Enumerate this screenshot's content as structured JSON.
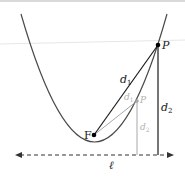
{
  "diagram": {
    "labels": {
      "point_p": "P",
      "point_p_secondary": "P",
      "focus": "F",
      "d1": "d",
      "d1_sub": "1",
      "d2": "d",
      "d2_sub": "2",
      "d1_secondary": "d",
      "d1_secondary_sub": "1",
      "d2_secondary": "d",
      "d2_secondary_sub": "2",
      "directrix": "ℓ"
    },
    "colors": {
      "primary_stroke": "#1a1a1a",
      "curve_stroke": "#4a4a4a",
      "secondary_stroke": "#a8a8a8",
      "secondary_text": "#a0a0a0",
      "background": "#ffffff",
      "faint_line": "#e6e6e6"
    }
  }
}
